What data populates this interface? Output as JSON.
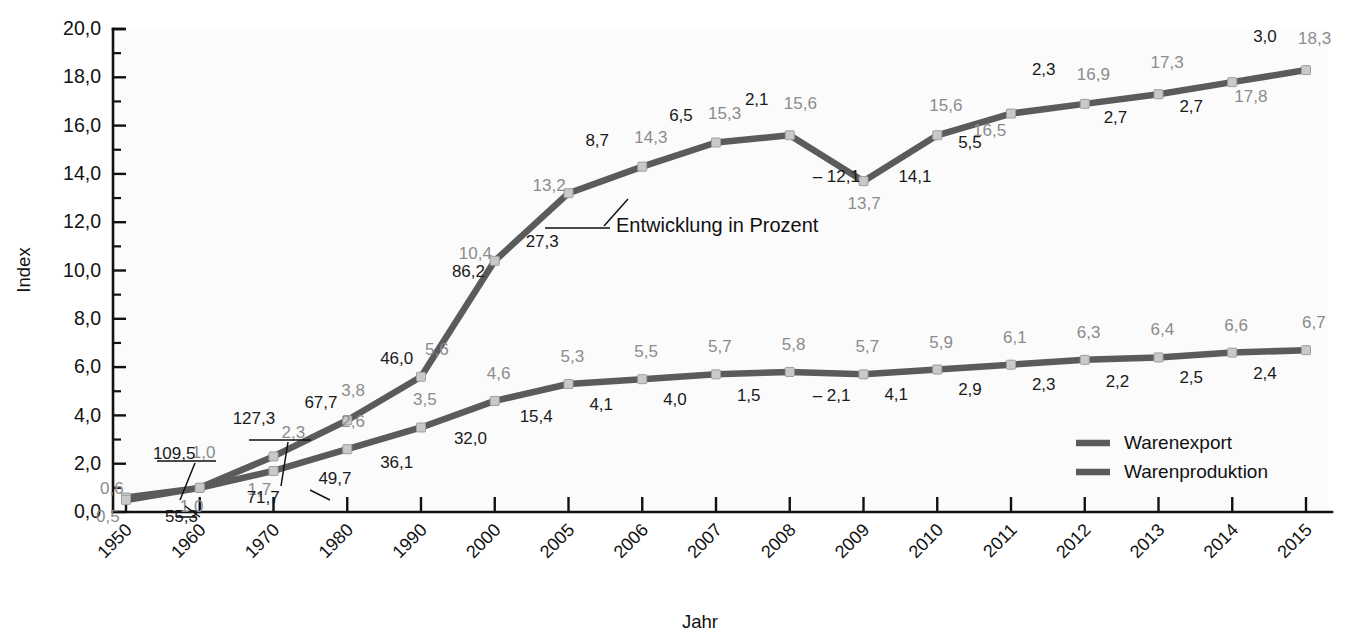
{
  "chart_data": {
    "type": "line",
    "title": "",
    "xlabel": "Jahr",
    "ylabel": "Index",
    "ylim": [
      0,
      20
    ],
    "yticks": [
      "0,0",
      "2,0",
      "4,0",
      "6,0",
      "8,0",
      "10,0",
      "12,0",
      "14,0",
      "16,0",
      "18,0",
      "20,0"
    ],
    "ytick_values": [
      0,
      2,
      4,
      6,
      8,
      10,
      12,
      14,
      16,
      18,
      20
    ],
    "grid": false,
    "legend_position": "bottom-right",
    "categories": [
      "1950",
      "1960",
      "1970",
      "1980",
      "1990",
      "2000",
      "2005",
      "2006",
      "2007",
      "2008",
      "2009",
      "2010",
      "2011",
      "2012",
      "2013",
      "2014",
      "2015"
    ],
    "series": [
      {
        "name": "Warenexport",
        "color": "#5b5b5b",
        "values": [
          0.6,
          1.0,
          2.3,
          3.8,
          5.6,
          10.4,
          13.2,
          14.3,
          15.3,
          15.6,
          13.7,
          15.6,
          16.5,
          16.9,
          17.3,
          17.8,
          18.3
        ],
        "value_labels": [
          "0,6",
          "1,0",
          "2,3",
          "3,8",
          "5,6",
          "10,4",
          "13,2",
          "14,3",
          "15,3",
          "15,6",
          "13,7",
          "15,6",
          "16,5",
          "16,9",
          "17,3",
          "17,8",
          "18,3"
        ],
        "growth_labels": [
          "109,5",
          "127,3",
          "67,7",
          "46,0",
          "86,2",
          "27,3",
          "8,7",
          "6,5",
          "2,1",
          "-12,1",
          "14,1",
          "5,5",
          "2,3",
          "2,7",
          "2,7",
          "3,0"
        ]
      },
      {
        "name": "Warenproduktion",
        "color": "#5b5b5b",
        "values": [
          0.5,
          1.0,
          1.7,
          2.6,
          3.5,
          4.6,
          5.3,
          5.5,
          5.7,
          5.8,
          5.7,
          5.9,
          6.1,
          6.3,
          6.4,
          6.6,
          6.7
        ],
        "value_labels": [
          "0,5",
          "1,0",
          "1,7",
          "2,6",
          "3,5",
          "4,6",
          "5,3",
          "5,5",
          "5,7",
          "5,8",
          "5,7",
          "5,9",
          "6,1",
          "6,3",
          "6,4",
          "6,6",
          "6,7"
        ],
        "growth_labels": [
          "55,3",
          "71,7",
          "49,7",
          "36,1",
          "32,0",
          "15,4",
          "4,1",
          "4,0",
          "1,5",
          "-2,1",
          "4,1",
          "2,9",
          "2,3",
          "2,2",
          "2,5",
          "2,4"
        ]
      }
    ],
    "annotation": {
      "text": "Entwicklung in Prozent",
      "points_to": "8,7"
    }
  },
  "legend": {
    "items": [
      {
        "label": "Warenexport",
        "color": "#5b5b5b"
      },
      {
        "label": "Warenproduktion",
        "color": "#5b5b5b"
      }
    ]
  },
  "axes": {
    "y_title": "Index",
    "x_title": "Jahr"
  }
}
